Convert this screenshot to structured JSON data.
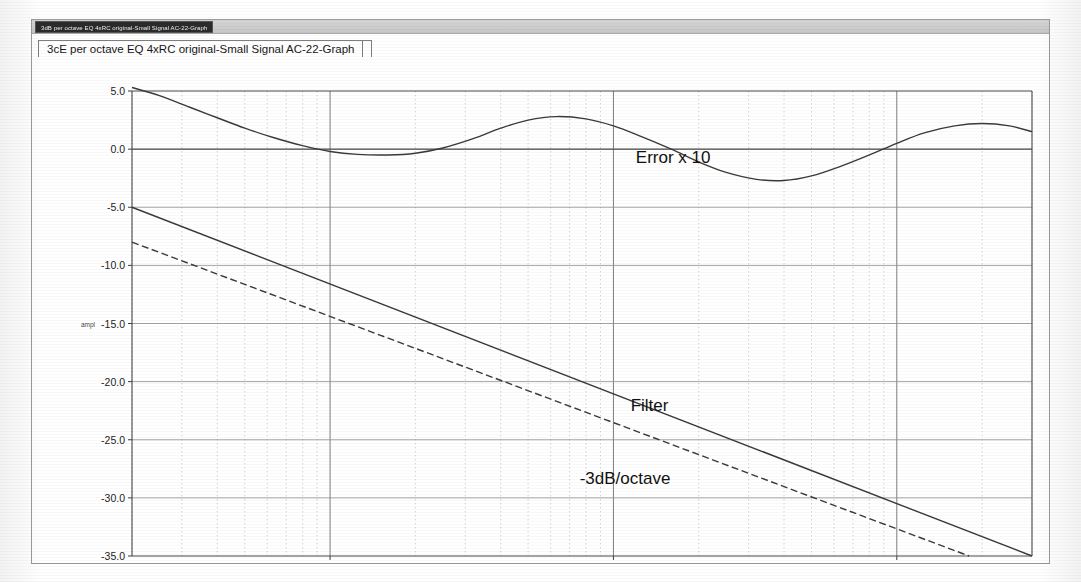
{
  "window": {
    "title": "3dB per octave EQ 4xRC original-Small Signal AC-22-Graph",
    "tab_label": "3cE per octave EQ 4xRC original-Small Signal AC-22-Graph"
  },
  "chart_data": {
    "type": "line",
    "title": "",
    "xlabel": "FREQ",
    "ylabel": "ampl",
    "xscale": "log",
    "xlim": [
      20,
      30000
    ],
    "ylim": [
      -35,
      5
    ],
    "grid": true,
    "legend_position": "inline-annotations",
    "yticks": [
      "5.0",
      "0.0",
      "-5.0",
      "-10.0",
      "-15.0",
      "-20.0",
      "-25.0",
      "-30.0",
      "-35.0"
    ],
    "ytick_values": [
      5,
      0,
      -5,
      -10,
      -15,
      -20,
      -25,
      -30,
      -35
    ],
    "xticks": [
      "100",
      "1k",
      "10k"
    ],
    "xtick_values": [
      100,
      1000,
      10000
    ],
    "annotations": [
      {
        "text": "Error x 10",
        "x": 1200,
        "y": -1.2
      },
      {
        "text": "Filter",
        "x": 1150,
        "y": -22.5
      },
      {
        "text": "-3dB/octave",
        "x": 760,
        "y": -28.8
      }
    ],
    "series": [
      {
        "name": "Error x 10",
        "style": "solid",
        "color": "#3a3a3a",
        "x": [
          20,
          25,
          32,
          40,
          50,
          63,
          80,
          100,
          125,
          160,
          200,
          250,
          320,
          400,
          500,
          630,
          800,
          1000,
          1250,
          1600,
          2000,
          2500,
          3200,
          4000,
          5000,
          6300,
          8000,
          10000,
          12500,
          16000,
          20000,
          25000,
          30000
        ],
        "y": [
          5.3,
          4.6,
          3.6,
          2.7,
          1.8,
          1.0,
          0.3,
          -0.2,
          -0.45,
          -0.5,
          -0.35,
          0.1,
          0.9,
          1.8,
          2.5,
          2.8,
          2.6,
          2.0,
          1.1,
          0.0,
          -1.1,
          -2.0,
          -2.6,
          -2.7,
          -2.3,
          -1.5,
          -0.5,
          0.5,
          1.4,
          2.0,
          2.2,
          2.0,
          1.5
        ]
      },
      {
        "name": "Filter",
        "style": "solid",
        "color": "#3a3a3a",
        "x": [
          20,
          30000
        ],
        "y": [
          -5.0,
          -35.0
        ]
      },
      {
        "name": "-3dB/octave",
        "style": "dashed",
        "color": "#3a3a3a",
        "x": [
          20,
          18000
        ],
        "y": [
          -8.0,
          -35.0
        ]
      }
    ]
  }
}
